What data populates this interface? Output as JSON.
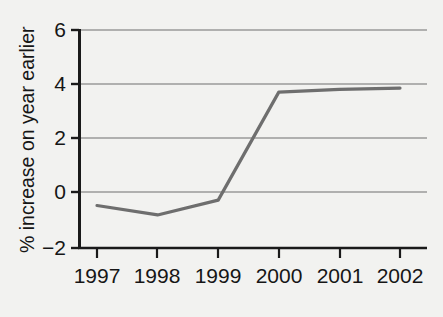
{
  "chart_data": {
    "type": "line",
    "title": "",
    "subtitle": "",
    "xlabel": "",
    "ylabel": "% increase on year earlier",
    "categories": [
      "1997",
      "1998",
      "1999",
      "2000",
      "2001",
      "2002"
    ],
    "x": [
      1997,
      1998,
      1999,
      2000,
      2001,
      2002
    ],
    "values": [
      -0.5,
      -0.85,
      -0.3,
      3.7,
      3.8,
      3.85
    ],
    "series": [
      {
        "name": "% increase on year earlier",
        "values": [
          -0.5,
          -0.85,
          -0.3,
          3.7,
          3.8,
          3.85
        ]
      }
    ],
    "ylim": [
      -2,
      6
    ],
    "xlim": [
      1997,
      2002
    ],
    "yticks": [
      -2,
      0,
      2,
      4,
      6
    ],
    "ytick_labels": [
      "−2",
      "0",
      "2",
      "4",
      "6"
    ],
    "xticks": [
      1997,
      1998,
      1999,
      2000,
      2001,
      2002
    ],
    "xtick_labels": [
      "1997",
      "1998",
      "1999",
      "2000",
      "2001",
      "2002"
    ],
    "grid": "horizontal",
    "legend": "none",
    "annotations": [],
    "colors": {
      "background": "#f2f2f0",
      "line": "#6e6e6e",
      "gridline": "#9a9a9a",
      "axis": "#1a1a1a",
      "text": "#161616"
    },
    "line_width": 3.2
  }
}
